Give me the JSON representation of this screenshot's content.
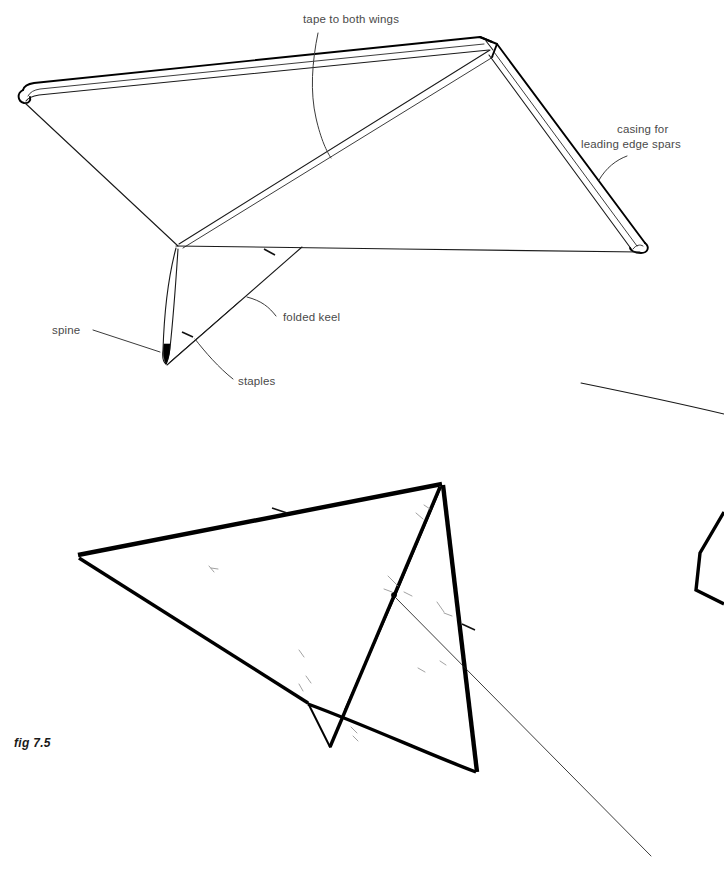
{
  "figure": {
    "caption": "fig 7.5",
    "title": "Delta kite assembly — taping wings, keel and spars",
    "background_color": "#ffffff",
    "ink_color": "#000000",
    "label_color": "#4a4a4a"
  },
  "labels": {
    "tape_to_both_wings": "tape to both wings",
    "casing_line1": "casing for",
    "casing_line2": "leading edge spars",
    "spine": "spine",
    "folded_keel": "folded keel",
    "staples": "staples"
  },
  "upper_figure": {
    "name": "delta kite sail with spar casings, top view",
    "parts": [
      "left wing leading edge casing",
      "right wing leading edge casing",
      "nose apex",
      "sail trailing edge",
      "folded keel",
      "spine",
      "staples along keel"
    ]
  },
  "lower_figure": {
    "name": "assembled delta kite with bridle, perspective view",
    "parts": [
      "bold leading edge spars",
      "keel",
      "spine",
      "bridle point",
      "bridle line"
    ]
  },
  "edge_fragments": {
    "thin_line_fragment": "partial rule line cropped at right edge",
    "kite_fragment": "partial kite outline cropped at right edge"
  }
}
